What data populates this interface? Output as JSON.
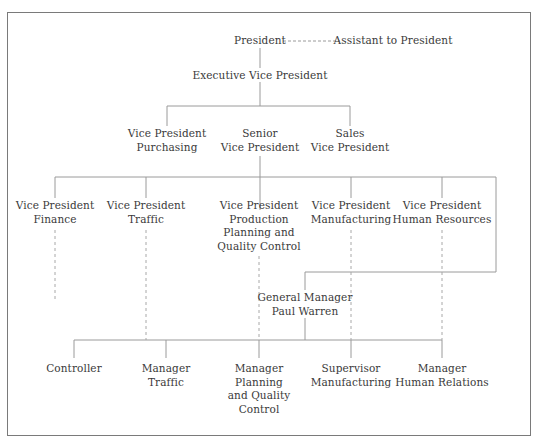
{
  "chart": {
    "type": "org-chart",
    "line_color": "#9a9a9a",
    "frame_color": "#7a7a7a",
    "nodes": {
      "president": {
        "lines": [
          "President"
        ]
      },
      "assistant": {
        "lines": [
          "Assistant to President"
        ]
      },
      "evp": {
        "lines": [
          "Executive Vice President"
        ]
      },
      "vp_purchasing": {
        "lines": [
          "Vice President",
          "Purchasing"
        ]
      },
      "senior_vp": {
        "lines": [
          "Senior",
          "Vice President"
        ]
      },
      "sales_vp": {
        "lines": [
          "Sales",
          "Vice President"
        ]
      },
      "vp_finance": {
        "lines": [
          "Vice President",
          "Finance"
        ]
      },
      "vp_traffic": {
        "lines": [
          "Vice President",
          "Traffic"
        ]
      },
      "vp_production": {
        "lines": [
          "Vice President",
          "Production",
          "Planning and",
          "Quality Control"
        ]
      },
      "vp_manufacturing": {
        "lines": [
          "Vice President",
          "Manufacturing"
        ]
      },
      "vp_hr": {
        "lines": [
          "Vice President",
          "Human Resources"
        ]
      },
      "general_manager": {
        "lines": [
          "General Manager",
          "Paul Warren"
        ]
      },
      "controller": {
        "lines": [
          "Controller"
        ]
      },
      "mgr_traffic": {
        "lines": [
          "Manager",
          "Traffic"
        ]
      },
      "mgr_planning": {
        "lines": [
          "Manager",
          "Planning",
          "and Quality",
          "Control"
        ]
      },
      "supervisor_mfg": {
        "lines": [
          "Supervisor",
          "Manufacturing"
        ]
      },
      "mgr_human_relations": {
        "lines": [
          "Manager",
          "Human Relations"
        ]
      }
    },
    "relationships": [
      {
        "from": "president",
        "to": "assistant",
        "style": "dashed"
      },
      {
        "from": "president",
        "to": "evp",
        "style": "solid"
      },
      {
        "from": "evp",
        "to": "vp_purchasing",
        "style": "solid"
      },
      {
        "from": "evp",
        "to": "senior_vp",
        "style": "solid"
      },
      {
        "from": "evp",
        "to": "sales_vp",
        "style": "solid"
      },
      {
        "from": "senior_vp",
        "to": "vp_finance",
        "style": "solid"
      },
      {
        "from": "senior_vp",
        "to": "vp_traffic",
        "style": "solid"
      },
      {
        "from": "senior_vp",
        "to": "vp_production",
        "style": "solid"
      },
      {
        "from": "senior_vp",
        "to": "vp_manufacturing",
        "style": "solid"
      },
      {
        "from": "senior_vp",
        "to": "vp_hr",
        "style": "solid"
      },
      {
        "from": "senior_vp",
        "to": "general_manager",
        "style": "solid"
      },
      {
        "from": "general_manager",
        "to": "controller",
        "style": "solid"
      },
      {
        "from": "general_manager",
        "to": "mgr_traffic",
        "style": "solid"
      },
      {
        "from": "general_manager",
        "to": "mgr_planning",
        "style": "solid"
      },
      {
        "from": "general_manager",
        "to": "supervisor_mfg",
        "style": "solid"
      },
      {
        "from": "general_manager",
        "to": "mgr_human_relations",
        "style": "solid"
      },
      {
        "from": "vp_finance",
        "to": "controller",
        "style": "dashed"
      },
      {
        "from": "vp_traffic",
        "to": "mgr_traffic",
        "style": "dashed"
      },
      {
        "from": "vp_production",
        "to": "mgr_planning",
        "style": "dashed"
      },
      {
        "from": "vp_manufacturing",
        "to": "supervisor_mfg",
        "style": "dashed"
      },
      {
        "from": "vp_hr",
        "to": "mgr_human_relations",
        "style": "dashed"
      }
    ]
  }
}
